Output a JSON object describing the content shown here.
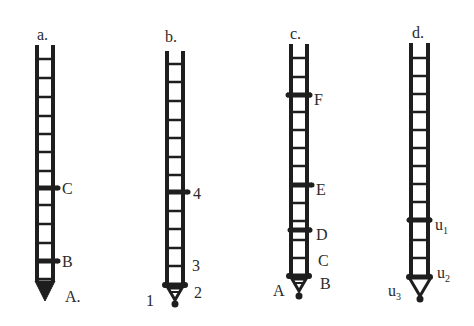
{
  "colors": {
    "ink": "#1e1e1e",
    "label": "#2a2a2a",
    "background": "#ffffff"
  },
  "ladders": [
    {
      "id": "a",
      "title": "a.",
      "markers": [
        {
          "label": "C",
          "position": "middle"
        },
        {
          "label": "B",
          "position": "lower"
        }
      ],
      "tip_label": "A.",
      "tip_shape": "filled-triangle"
    },
    {
      "id": "b",
      "title": "b.",
      "markers": [
        {
          "label": "4",
          "position": "middle"
        }
      ],
      "bottom_labels": {
        "above_base": "3",
        "base": "2",
        "tip": "1"
      },
      "tip_shape": "small-triangle-with-dot"
    },
    {
      "id": "c",
      "title": "c.",
      "markers": [
        {
          "label": "F",
          "position": "upper"
        },
        {
          "label": "E",
          "position": "middle"
        },
        {
          "label": "D",
          "position": "lower"
        }
      ],
      "bottom_labels": {
        "above_base": "C",
        "base": "B",
        "tip": "A"
      },
      "tip_shape": "small-triangle-with-dot"
    },
    {
      "id": "d",
      "title": "d.",
      "markers": [
        {
          "label": "u",
          "subscript": "1",
          "position": "lower"
        }
      ],
      "bottom_labels": {
        "base": {
          "label": "u",
          "subscript": "2"
        },
        "tip": {
          "label": "u",
          "subscript": "3"
        }
      },
      "tip_shape": "open-triangle-with-dot"
    }
  ]
}
